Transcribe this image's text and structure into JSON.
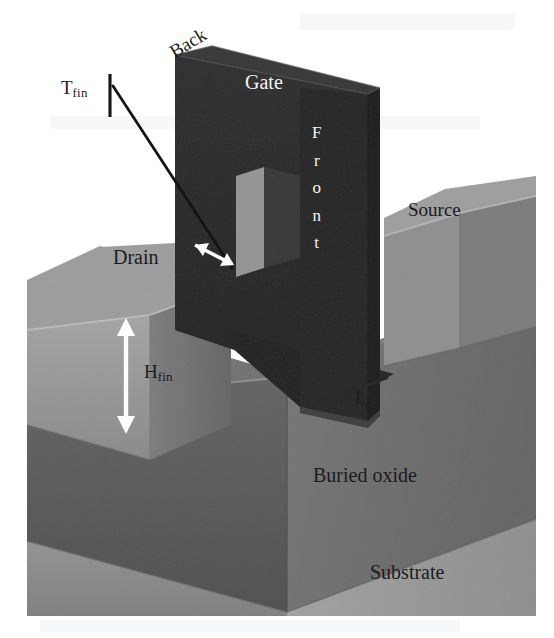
{
  "figure": {
    "background_color": "#ffffff",
    "canvas": {
      "width": 554,
      "height": 638
    },
    "image_bounds": {
      "left": 27,
      "top": 20,
      "right": 536,
      "bottom": 616
    }
  },
  "labels": {
    "back": "Back",
    "gate": "Gate",
    "front_letters": [
      "F",
      "r",
      "o",
      "n",
      "t"
    ],
    "source": "Source",
    "drain": "Drain",
    "buried_oxide": "Buried oxide",
    "substrate": "Substrate"
  },
  "dimensions": {
    "t_fin": {
      "symbol": "T",
      "subscript": "fin"
    },
    "h_fin": {
      "symbol": "H",
      "subscript": "fin"
    },
    "l_g": {
      "symbol": "L",
      "subscript": "g"
    }
  },
  "colors": {
    "gate_front": "#6d6d6d",
    "gate_side": "#636363",
    "gate_top": "#7a7a7a",
    "fin_top": "#c7c7c7",
    "fin_front": "#c2c2c2",
    "fin_side": "#ababab",
    "buried_oxide_front": "#9a9a9a",
    "buried_oxide_right": "#a9a9a9",
    "buried_oxide_top": "#b0b0b0",
    "substrate_front": "#bcbcbc",
    "substrate_right": "#c6c6c6",
    "label_dark": "#1c1c1c",
    "label_white": "#f2f2f2",
    "arrow_white": "#ffffff",
    "leader_line": "#141414"
  },
  "annotations": {
    "t_fin_arrow": "white-double-arrow-fin-thickness",
    "h_fin_arrow": "white-vertical-double-arrow-fin-height",
    "l_g_arrow": "dark-double-arrow-gate-length",
    "t_fin_leader": "leader-line-from-tfin-label-to-fin-top"
  }
}
